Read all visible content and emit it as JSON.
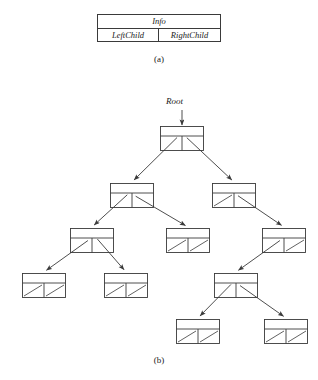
{
  "figure": {
    "title_a": "(a)",
    "title_b": "(b)",
    "root_label": "Root"
  },
  "struct_node": {
    "info_label": "Info",
    "left_label": "LeftChild",
    "right_label": "RightChild",
    "x": 97,
    "y": 14,
    "width": 124,
    "height": 28
  },
  "captions": {
    "a": {
      "text": "(a)",
      "x": 0,
      "y": 54
    },
    "b": {
      "text": "(b)",
      "x": 0,
      "y": 355
    }
  },
  "root_pointer": {
    "label": "Root",
    "label_x": 166,
    "label_y": 96,
    "arrow_x": 182,
    "arrow_y1": 110,
    "arrow_y2": 125
  },
  "colors": {
    "ink": "#3a3a3a",
    "text": "#1a1a1a",
    "background": "#ffffff"
  },
  "tree": {
    "node_width": 44,
    "node_height": 25,
    "info_height": 10,
    "nodes": [
      {
        "id": "n1",
        "x": 160,
        "y": 126,
        "left": "n2",
        "right": "n3"
      },
      {
        "id": "n2",
        "x": 110,
        "y": 183,
        "left": "n4",
        "right": "n5"
      },
      {
        "id": "n3",
        "x": 212,
        "y": 183,
        "left": null,
        "right": "n6"
      },
      {
        "id": "n4",
        "x": 70,
        "y": 228,
        "left": "n7",
        "right": "n8"
      },
      {
        "id": "n5",
        "x": 166,
        "y": 228,
        "left": null,
        "right": null
      },
      {
        "id": "n6",
        "x": 262,
        "y": 228,
        "left": "n9",
        "right": null
      },
      {
        "id": "n7",
        "x": 22,
        "y": 273,
        "left": null,
        "right": null
      },
      {
        "id": "n8",
        "x": 104,
        "y": 273,
        "left": null,
        "right": null
      },
      {
        "id": "n9",
        "x": 214,
        "y": 273,
        "left": "n10",
        "right": "n11"
      },
      {
        "id": "n10",
        "x": 176,
        "y": 319,
        "left": null,
        "right": null
      },
      {
        "id": "n11",
        "x": 264,
        "y": 319,
        "left": null,
        "right": null
      }
    ]
  }
}
